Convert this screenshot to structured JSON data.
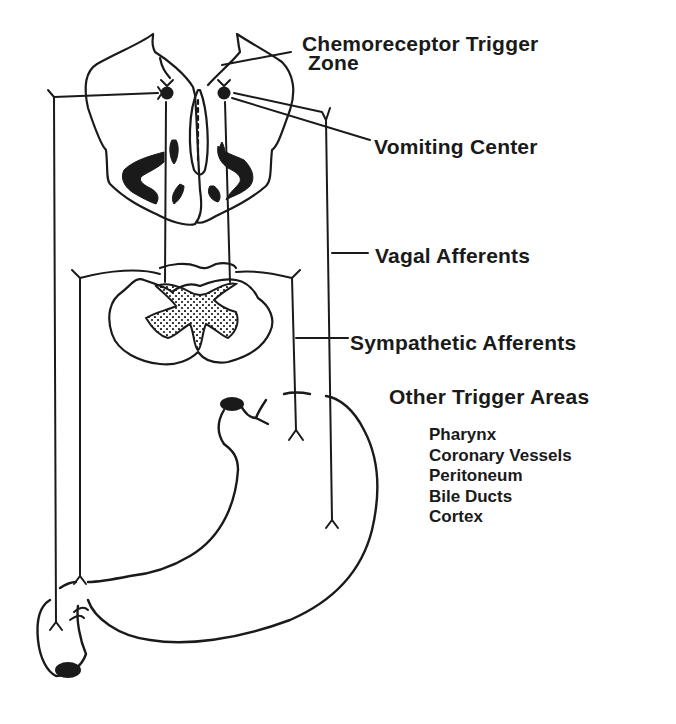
{
  "figure": {
    "labels": {
      "ctz_line1": "Chemoreceptor Trigger",
      "ctz_line2": "Zone",
      "vomiting_center": "Vomiting Center",
      "vagal_afferents": "Vagal Afferents",
      "sympathetic_afferents": "Sympathetic Afferents",
      "other_trigger_areas": "Other Trigger Areas"
    },
    "other_trigger_areas": [
      "Pharynx",
      "Coronary Vessels",
      "Peritoneum",
      "Bile Ducts",
      "Cortex"
    ],
    "structures": [
      "medulla-cross-section",
      "spinal-cord-cross-section",
      "stomach"
    ],
    "colors": {
      "ink": "#1a1a1a",
      "background": "#ffffff"
    }
  }
}
